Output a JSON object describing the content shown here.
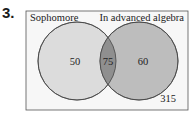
{
  "problem_number": "3.",
  "diagram": {
    "type": "venn",
    "sets": [
      {
        "label": "Sophomore",
        "only_value": "50"
      },
      {
        "label": "In advanced algebra",
        "only_value": "60"
      }
    ],
    "intersection_value": "75",
    "outside_value": "315",
    "colors": {
      "frame": "#555555",
      "left_fill": "#dcdcdc",
      "right_fill": "#bdbdbd",
      "intersection_fill": "#8f8f8f",
      "background": "#f7f7f7"
    }
  }
}
